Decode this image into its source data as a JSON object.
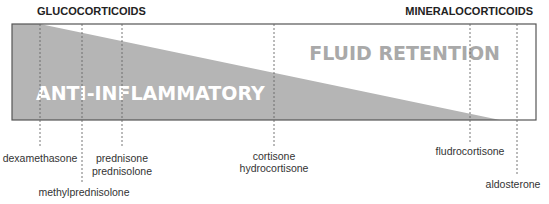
{
  "headers": {
    "left": "GLUCOCORTICOIDS",
    "right": "MINERALOCORTICOIDS"
  },
  "regions": {
    "anti_inflammatory": "ANTI-INFLAMMATORY",
    "fluid_retention": "FLUID RETENTION"
  },
  "colors": {
    "wedge_fill": "#b5b5b5",
    "anti_inflammatory_text": "#ffffff",
    "fluid_retention_text": "#a9a9a9",
    "border": "#555555",
    "dashed_line": "#666666"
  },
  "drugs": [
    {
      "lines": [
        "dexamethasone"
      ]
    },
    {
      "lines": [
        "methylprednisolone"
      ]
    },
    {
      "lines": [
        "prednisone",
        "prednisolone"
      ]
    },
    {
      "lines": [
        "cortisone",
        "hydrocortisone"
      ]
    },
    {
      "lines": [
        "fludrocortisone"
      ]
    },
    {
      "lines": [
        "aldosterone"
      ]
    }
  ]
}
